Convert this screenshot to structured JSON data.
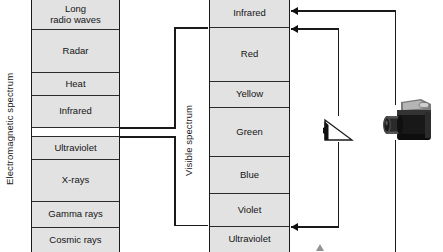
{
  "diagram": {
    "axis_labels": {
      "electromagnetic": "Electromagnetic spectrum",
      "visible": "Visible spectrum"
    },
    "colors": {
      "band_fill": "#e2e2e2",
      "band_gap_fill": "#ffffff",
      "stroke": "#1a1a1a",
      "arrow": "#101010",
      "text": "#141414",
      "background": "#ffffff"
    }
  },
  "electromagnetic_spectrum": {
    "label": "Electromagnetic spectrum",
    "bands": [
      {
        "name": "long-radio-waves",
        "label": "Long\nradio waves",
        "top": 0,
        "height": 30,
        "fill": "gray"
      },
      {
        "name": "radar",
        "label": "Radar",
        "top": 30,
        "height": 43,
        "fill": "gray"
      },
      {
        "name": "heat",
        "label": "Heat",
        "top": 73,
        "height": 23,
        "fill": "gray"
      },
      {
        "name": "infrared",
        "label": "Infrared",
        "top": 96,
        "height": 32,
        "fill": "gray"
      },
      {
        "name": "visible-slice",
        "label": "",
        "top": 128,
        "height": 9,
        "fill": "white"
      },
      {
        "name": "ultraviolet",
        "label": "Ultraviolet",
        "top": 137,
        "height": 23,
        "fill": "gray"
      },
      {
        "name": "x-rays",
        "label": "X-rays",
        "top": 160,
        "height": 42,
        "fill": "gray"
      },
      {
        "name": "gamma-rays",
        "label": "Gamma rays",
        "top": 202,
        "height": 26,
        "fill": "gray"
      },
      {
        "name": "cosmic-rays",
        "label": "Cosmic rays",
        "top": 228,
        "height": 24,
        "fill": "gray"
      }
    ]
  },
  "visible_spectrum": {
    "label": "Visible spectrum",
    "bands": [
      {
        "name": "infrared",
        "label": "Infrared",
        "top": 0,
        "height": 28,
        "fill": "gray"
      },
      {
        "name": "red",
        "label": "Red",
        "top": 28,
        "height": 54,
        "fill": "gray"
      },
      {
        "name": "yellow",
        "label": "Yellow",
        "top": 82,
        "height": 26,
        "fill": "gray"
      },
      {
        "name": "green",
        "label": "Green",
        "top": 108,
        "height": 49,
        "fill": "gray"
      },
      {
        "name": "blue",
        "label": "Blue",
        "top": 157,
        "height": 37,
        "fill": "gray"
      },
      {
        "name": "violet",
        "label": "Violet",
        "top": 194,
        "height": 33,
        "fill": "gray"
      },
      {
        "name": "ultraviolet",
        "label": "Ultraviolet",
        "top": 227,
        "height": 25,
        "fill": "gray"
      }
    ]
  },
  "objects": {
    "prism": {
      "name": "prism-eye",
      "label": ""
    },
    "camera": {
      "name": "camera",
      "label": ""
    }
  },
  "arrows": [
    {
      "name": "camera-to-infrared-top",
      "direction": "left"
    },
    {
      "name": "prism-to-infrared-red",
      "direction": "left"
    },
    {
      "name": "prism-to-violet-uv",
      "direction": "left"
    },
    {
      "name": "camera-return-bottom",
      "direction": "up"
    }
  ],
  "edge_text": {
    "lines": [
      "",
      "",
      "",
      "",
      "",
      ""
    ]
  }
}
